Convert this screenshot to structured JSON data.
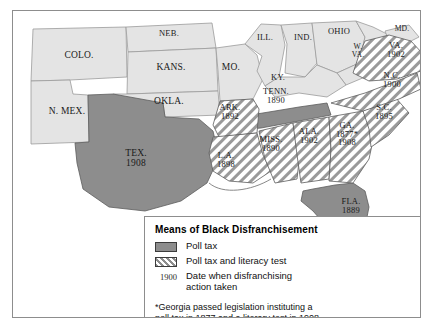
{
  "map": {
    "title": "Means of Black Disfranchisement",
    "colors": {
      "no_action": "#e4e4e4",
      "poll_tax": "#8d8d8d",
      "poll_tax_and_literacy": "#8d8d8d",
      "border": "#8d8d8d",
      "label_text": "#1a1a1a"
    },
    "states": [
      {
        "id": "colorado",
        "name": "COLO.",
        "year": "",
        "category": "no_action"
      },
      {
        "id": "nebraska",
        "name": "NEB.",
        "year": "",
        "category": "no_action"
      },
      {
        "id": "kansas",
        "name": "KANS.",
        "year": "",
        "category": "no_action"
      },
      {
        "id": "missouri",
        "name": "MO.",
        "year": "",
        "category": "no_action"
      },
      {
        "id": "illinois",
        "name": "ILL.",
        "year": "",
        "category": "no_action"
      },
      {
        "id": "indiana",
        "name": "IND.",
        "year": "",
        "category": "no_action"
      },
      {
        "id": "ohio",
        "name": "OHIO",
        "year": "",
        "category": "no_action"
      },
      {
        "id": "maryland",
        "name": "MD.",
        "year": "",
        "category": "no_action"
      },
      {
        "id": "west-virginia",
        "name": "W. VA.",
        "year": "",
        "category": "no_action"
      },
      {
        "id": "kentucky",
        "name": "KY.",
        "year": "",
        "category": "no_action"
      },
      {
        "id": "new-mexico",
        "name": "N. MEX.",
        "year": "",
        "category": "no_action"
      },
      {
        "id": "oklahoma",
        "name": "OKLA.",
        "year": "",
        "category": "no_action"
      },
      {
        "id": "texas",
        "name": "TEX.",
        "year": "1908",
        "category": "poll_tax"
      },
      {
        "id": "florida",
        "name": "FLA.",
        "year": "1889",
        "category": "poll_tax"
      },
      {
        "id": "tennessee",
        "name": "TENN.",
        "year": "1890",
        "category": "poll_tax"
      },
      {
        "id": "arkansas",
        "name": "ARK.",
        "year": "1892",
        "category": "poll_tax_and_literacy"
      },
      {
        "id": "louisiana",
        "name": "L.A.",
        "year": "1898",
        "category": "poll_tax_and_literacy"
      },
      {
        "id": "mississippi",
        "name": "MISS.",
        "year": "1890",
        "category": "poll_tax_and_literacy"
      },
      {
        "id": "alabama",
        "name": "ALA.",
        "year": "1902",
        "category": "poll_tax_and_literacy"
      },
      {
        "id": "georgia",
        "name": "GA.",
        "year": "1877*",
        "year2": "1908",
        "category": "poll_tax_and_literacy"
      },
      {
        "id": "south-carolina",
        "name": "S.C.",
        "year": "1895",
        "category": "poll_tax_and_literacy"
      },
      {
        "id": "north-carolina",
        "name": "N.C.",
        "year": "1900",
        "category": "poll_tax_and_literacy"
      },
      {
        "id": "virginia",
        "name": "VA.",
        "year": "1902",
        "category": "poll_tax_and_literacy"
      }
    ]
  },
  "legend": {
    "title": "Means of Black Disfranchisement",
    "items": [
      {
        "swatch": "solid",
        "label": "Poll tax"
      },
      {
        "swatch": "hatched",
        "label": "Poll tax and literacy test"
      }
    ],
    "date_key": {
      "sample_year": "1900",
      "line1": "Date when disfranchising",
      "line2": "action taken"
    },
    "footnote_line1": "*Georgia passed legislation instituting a",
    "footnote_line2": "poll tax in 1877 and a literary test in 1908."
  }
}
